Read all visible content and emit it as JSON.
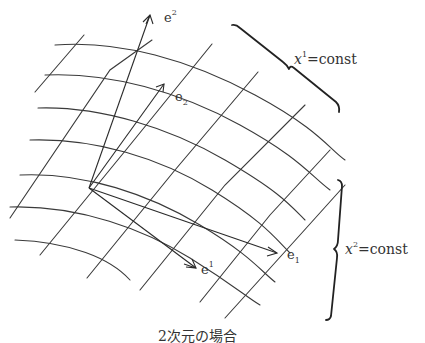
{
  "figure": {
    "caption": "2次元の場合",
    "labels": {
      "e_upper2_base": "e",
      "e_upper2_sup": "2",
      "e_lower2_base": "e",
      "e_lower2_sub": "2",
      "e_upper1_base": "e",
      "e_upper1_sup": "1",
      "e_lower1_base": "e",
      "e_lower1_sub": "1"
    },
    "brace_top": {
      "var": "x",
      "sup": "1",
      "rhs": "=const"
    },
    "brace_right": {
      "var": "x",
      "sup": "2",
      "rhs": "=const"
    },
    "colors": {
      "line": "#3a3a3a",
      "text": "#333333",
      "background": "#ffffff"
    }
  }
}
